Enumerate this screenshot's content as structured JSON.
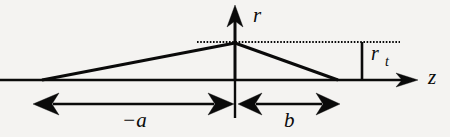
{
  "figure": {
    "name": "tapered-beam-profile-diagram",
    "background_color": "#f4f3f1",
    "ink_color": "#0a0a0a"
  },
  "axes": {
    "horizontal": {
      "label": "z",
      "label_x": 428,
      "label_y": 84,
      "font_size": 21,
      "baseline_y": 80,
      "x_start": 0,
      "x_end": 404,
      "arrow_tip_x": 418,
      "arrow_half_height": 7,
      "stroke_width": 2.6
    },
    "vertical": {
      "label": "r",
      "label_x": 253,
      "label_y": 22,
      "font_size": 21,
      "axis_x": 235,
      "y_bottom": 80,
      "y_top": 18,
      "arrow_tip_y": 5,
      "arrow_half_width": 8,
      "stroke_width": 3.0
    }
  },
  "profile": {
    "name": "triangular-profile",
    "left_vertex": {
      "x": 42,
      "y": 80
    },
    "apex": {
      "x": 235,
      "y": 43
    },
    "right_vertex": {
      "x": 338,
      "y": 80
    },
    "stroke_width": 3.0
  },
  "guide_line": {
    "name": "apex-level-dotted-line",
    "y": 42,
    "x_start": 197,
    "x_end": 400,
    "stroke_width": 2.0,
    "dash_pattern": "1.6 1.6"
  },
  "measure": {
    "label": "r",
    "subscript": "t",
    "label_x": 371,
    "label_y": 60,
    "subscript_x": 385,
    "subscript_y": 66,
    "font_size": 20,
    "subscript_font_size": 14,
    "tick_x": 362,
    "tick_y_top": 42,
    "tick_y_bottom": 80,
    "stroke_width": 2.6
  },
  "dimensions": [
    {
      "name": "dimension-minus-a",
      "label": "−a",
      "label_x": 122,
      "label_y": 127,
      "font_size": 21,
      "line_y": 104,
      "x_start": 33,
      "x_end": 234,
      "arrow_len": 26,
      "arrow_half_height": 11,
      "stroke_width": 2.4
    },
    {
      "name": "dimension-b",
      "label": "b",
      "label_x": 284,
      "label_y": 127,
      "font_size": 21,
      "line_y": 104,
      "x_start": 238,
      "x_end": 340,
      "arrow_len": 24,
      "arrow_half_height": 11,
      "stroke_width": 2.4
    }
  ],
  "axis_vertical_extension": {
    "name": "axis-lower-extension",
    "x": 235,
    "y_top": 80,
    "y_bottom": 118,
    "stroke_width": 2.4
  }
}
